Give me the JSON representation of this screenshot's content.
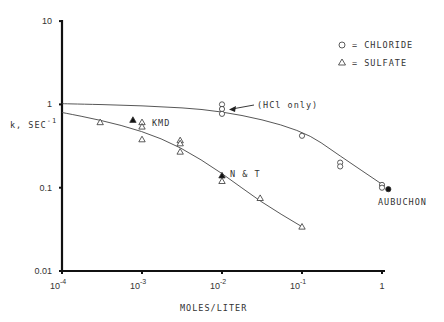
{
  "chart_data": {
    "type": "scatter",
    "title": "",
    "xlabel": "MOLES/LITER",
    "ylabel": "k, SEC",
    "ylabel_superscript": "-1",
    "xscale": "log",
    "yscale": "log",
    "xlim": [
      0.0001,
      1
    ],
    "ylim": [
      0.01,
      10
    ],
    "grid": false,
    "x_ticks": [
      {
        "base": "10",
        "exp": "-4",
        "value": 0.0001
      },
      {
        "base": "10",
        "exp": "-3",
        "value": 0.001
      },
      {
        "base": "10",
        "exp": "-2",
        "value": 0.01
      },
      {
        "base": "10",
        "exp": "-1",
        "value": 0.1
      },
      {
        "base": "1",
        "exp": "",
        "value": 1
      }
    ],
    "y_ticks": [
      {
        "label": "10",
        "value": 10
      },
      {
        "label": "1",
        "value": 1
      },
      {
        "label": "0.1",
        "value": 0.1
      },
      {
        "label": "0.01",
        "value": 0.01
      }
    ],
    "legend": {
      "position": "upper right",
      "entries": [
        {
          "marker": "circle",
          "label": "= CHLORIDE"
        },
        {
          "marker": "triangle",
          "label": "= SULFATE"
        }
      ]
    },
    "series": [
      {
        "name": "Chloride",
        "marker": "circle-open",
        "points": [
          {
            "x": 0.01,
            "y": 1.0
          },
          {
            "x": 0.01,
            "y": 0.88
          },
          {
            "x": 0.01,
            "y": 0.77
          },
          {
            "x": 0.1,
            "y": 0.42
          },
          {
            "x": 0.3,
            "y": 0.2
          },
          {
            "x": 0.3,
            "y": 0.18
          },
          {
            "x": 1.0,
            "y": 0.108
          },
          {
            "x": 1.0,
            "y": 0.1
          }
        ]
      },
      {
        "name": "Chloride (Aubuchon)",
        "marker": "circle-filled",
        "points": [
          {
            "x": 1.2,
            "y": 0.096
          }
        ]
      },
      {
        "name": "Sulfate",
        "marker": "triangle-open",
        "points": [
          {
            "x": 0.0003,
            "y": 0.61
          },
          {
            "x": 0.001,
            "y": 0.61
          },
          {
            "x": 0.001,
            "y": 0.54
          },
          {
            "x": 0.001,
            "y": 0.38
          },
          {
            "x": 0.003,
            "y": 0.37
          },
          {
            "x": 0.003,
            "y": 0.34
          },
          {
            "x": 0.003,
            "y": 0.27
          },
          {
            "x": 0.01,
            "y": 0.12
          },
          {
            "x": 0.03,
            "y": 0.075
          },
          {
            "x": 0.1,
            "y": 0.034
          }
        ]
      },
      {
        "name": "Sulfate (KMD, N & T)",
        "marker": "triangle-filled",
        "points": [
          {
            "x": 0.00077,
            "y": 0.65
          },
          {
            "x": 0.01,
            "y": 0.14
          }
        ]
      }
    ],
    "curves": [
      {
        "name": "Chloride fit",
        "points": [
          [
            0.0001,
            1.02
          ],
          [
            0.001,
            0.97
          ],
          [
            0.01,
            0.85
          ],
          [
            0.1,
            0.5
          ],
          [
            0.3,
            0.24
          ],
          [
            1,
            0.11
          ]
        ]
      },
      {
        "name": "Sulfate fit",
        "points": [
          [
            0.0001,
            0.8
          ],
          [
            0.0003,
            0.65
          ],
          [
            0.001,
            0.48
          ],
          [
            0.003,
            0.31
          ],
          [
            0.01,
            0.15
          ],
          [
            0.03,
            0.068
          ],
          [
            0.1,
            0.034
          ]
        ]
      }
    ],
    "annotations": [
      {
        "text": "(HCl only)",
        "arrow_to": {
          "x": 0.01,
          "y": 0.88
        }
      },
      {
        "text": "KMD"
      },
      {
        "text": "N & T"
      },
      {
        "text": "AUBUCHON"
      }
    ]
  }
}
